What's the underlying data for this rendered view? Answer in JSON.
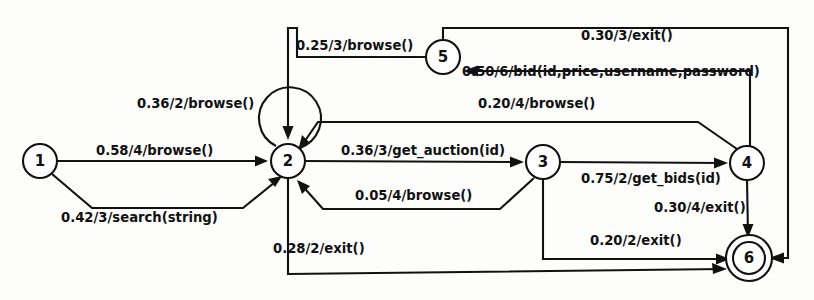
{
  "diagram": {
    "type": "state-machine",
    "background_color": "#fdfdfc",
    "stroke_color": "#111111",
    "label_format": "probability/weight/action",
    "nodes": [
      {
        "id": "1",
        "label": "1",
        "cx": 40,
        "cy": 161,
        "r": 17,
        "final": false
      },
      {
        "id": "2",
        "label": "2",
        "cx": 288,
        "cy": 161,
        "r": 17,
        "final": false
      },
      {
        "id": "3",
        "label": "3",
        "cx": 543,
        "cy": 162,
        "r": 17,
        "final": false
      },
      {
        "id": "4",
        "label": "4",
        "cx": 747,
        "cy": 163,
        "r": 17,
        "final": false
      },
      {
        "id": "5",
        "label": "5",
        "cx": 443,
        "cy": 57,
        "r": 17,
        "final": false
      },
      {
        "id": "6",
        "label": "6",
        "cx": 749,
        "cy": 258,
        "r": 16,
        "final": true
      }
    ],
    "edges": [
      {
        "from": "1",
        "to": "2",
        "label": "0.58/4/browse()",
        "probability": 0.58,
        "weight": 4,
        "action": "browse()",
        "label_x": 96,
        "label_y": 155
      },
      {
        "from": "1",
        "to": "2",
        "label": "0.42/3/search(string)",
        "probability": 0.42,
        "weight": 3,
        "action": "search(string)",
        "label_x": 61,
        "label_y": 222
      },
      {
        "from": "2",
        "to": "2",
        "label": "0.36/2/browse()",
        "probability": 0.36,
        "weight": 2,
        "action": "browse()",
        "label_x": 137,
        "label_y": 108
      },
      {
        "from": "5",
        "to": "2",
        "label": "0.25/3/browse()",
        "probability": 0.25,
        "weight": 3,
        "action": "browse()",
        "label_x": 296,
        "label_y": 50
      },
      {
        "from": "2",
        "to": "3",
        "label": "0.36/3/get_auction(id)",
        "probability": 0.36,
        "weight": 3,
        "action": "get_auction(id)",
        "label_x": 341,
        "label_y": 155
      },
      {
        "from": "3",
        "to": "2",
        "label": "0.05/4/browse()",
        "probability": 0.05,
        "weight": 4,
        "action": "browse()",
        "label_x": 355,
        "label_y": 200
      },
      {
        "from": "2",
        "to": "6",
        "label": "0.28/2/exit()",
        "probability": 0.28,
        "weight": 2,
        "action": "exit()",
        "label_x": 273,
        "label_y": 253
      },
      {
        "from": "3",
        "to": "4",
        "label": "0.75/2/get_bids(id)",
        "probability": 0.75,
        "weight": 2,
        "action": "get_bids(id)",
        "label_x": 581,
        "label_y": 183
      },
      {
        "from": "3",
        "to": "6",
        "label": "0.20/2/exit()",
        "probability": 0.2,
        "weight": 2,
        "action": "exit()",
        "label_x": 590,
        "label_y": 245
      },
      {
        "from": "4",
        "to": "6",
        "label": "0.30/4/exit()",
        "probability": 0.3,
        "weight": 4,
        "action": "exit()",
        "label_x": 654,
        "label_y": 212
      },
      {
        "from": "4",
        "to": "2",
        "label": "0.20/4/browse()",
        "probability": 0.2,
        "weight": 4,
        "action": "browse()",
        "label_x": 478,
        "label_y": 108
      },
      {
        "from": "4",
        "to": "5",
        "label": "0.50/6/bid(id,price,username,password)",
        "probability": 0.5,
        "weight": 6,
        "action": "bid(id,price,username,password)",
        "label_x": 462,
        "label_y": 76
      },
      {
        "from": "5",
        "to": "6",
        "label": "0.30/3/exit()",
        "probability": 0.3,
        "weight": 3,
        "action": "exit()",
        "label_x": 581,
        "label_y": 40
      }
    ]
  }
}
